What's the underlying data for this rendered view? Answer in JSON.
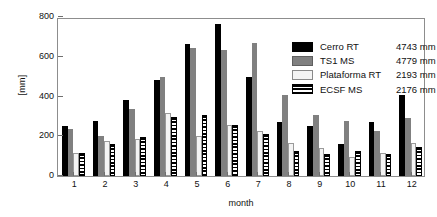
{
  "chart_data": {
    "type": "bar",
    "title": "",
    "xlabel": "month",
    "ylabel": "[mm]",
    "ylim": [
      0,
      800
    ],
    "yticks": [
      0,
      200,
      400,
      600,
      800
    ],
    "grid": false,
    "legend_position": "upper-right-inside",
    "categories": [
      "1",
      "2",
      "3",
      "4",
      "5",
      "6",
      "7",
      "8",
      "9",
      "10",
      "11",
      "12"
    ],
    "series": [
      {
        "name": "Cerro RT",
        "total": "4743 mm",
        "color": "#000000",
        "pattern": "solid-black",
        "values": [
          250,
          275,
          380,
          485,
          665,
          765,
          500,
          270,
          250,
          160,
          270,
          410
        ]
      },
      {
        "name": "TS1 MS",
        "total": "4779 mm",
        "color": "#808080",
        "pattern": "solid-gray",
        "values": [
          235,
          200,
          335,
          500,
          645,
          635,
          670,
          410,
          305,
          275,
          225,
          290
        ]
      },
      {
        "name": "Plataforma RT",
        "total": "2193 mm",
        "color": "#f4f4f4",
        "pattern": "solid-white",
        "values": [
          115,
          178,
          185,
          315,
          200,
          255,
          225,
          165,
          140,
          95,
          115,
          165
        ]
      },
      {
        "name": "ECSF MS",
        "total": "2176 mm",
        "color": "#000000",
        "pattern": "horizontal-stripes",
        "values": [
          115,
          160,
          195,
          298,
          305,
          255,
          210,
          125,
          110,
          125,
          110,
          145
        ]
      }
    ]
  }
}
